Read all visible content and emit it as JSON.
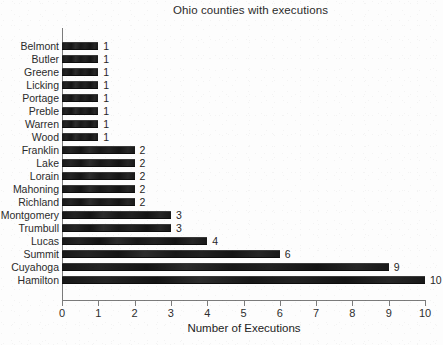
{
  "chart_data": {
    "type": "bar",
    "orientation": "horizontal",
    "title": "Ohio counties with executions",
    "xlabel": "Number of Executions",
    "ylabel": "",
    "xlim": [
      0,
      10
    ],
    "xticks": [
      "0",
      "1",
      "2",
      "3",
      "4",
      "5",
      "6",
      "7",
      "8",
      "9",
      "10"
    ],
    "grid": false,
    "legend": false,
    "bar_color": "#1d1d1d",
    "axis_color": "#7b7b7b",
    "categories": [
      "Belmont",
      "Butler",
      "Greene",
      "Licking",
      "Portage",
      "Preble",
      "Warren",
      "Wood",
      "Franklin",
      "Lake",
      "Lorain",
      "Mahoning",
      "Richland",
      "Montgomery",
      "Trumbull",
      "Lucas",
      "Summit",
      "Cuyahoga",
      "Hamilton"
    ],
    "values": [
      1,
      1,
      1,
      1,
      1,
      1,
      1,
      1,
      2,
      2,
      2,
      2,
      2,
      3,
      3,
      4,
      6,
      9,
      10
    ],
    "value_labels": [
      "1",
      "1",
      "1",
      "1",
      "1",
      "1",
      "1",
      "1",
      "2",
      "2",
      "2",
      "2",
      "2",
      "3",
      "3",
      "4",
      "6",
      "9",
      "10"
    ]
  }
}
